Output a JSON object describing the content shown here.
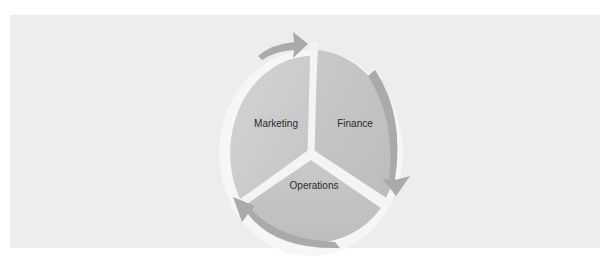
{
  "diagram": {
    "type": "cycle",
    "segments": [
      {
        "label": "Marketing",
        "color": "#c9c9c9"
      },
      {
        "label": "Finance",
        "color": "#c3c3c3"
      },
      {
        "label": "Operations",
        "color": "#c6c6c6"
      }
    ],
    "arrow_color": "#a8a8a8",
    "panel_background": "#ededed",
    "flow": [
      "Marketing",
      "Finance",
      "Operations",
      "Marketing"
    ]
  }
}
